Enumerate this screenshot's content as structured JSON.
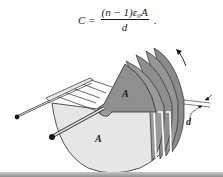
{
  "formula": {
    "lhs": "C =",
    "numerator": "(n − 1)ε₀A",
    "denominator": "d",
    "trailing": "."
  },
  "figure": {
    "labels": {
      "plate_area_upper": "A",
      "plate_area_lower": "A",
      "spacing": "d"
    },
    "colors": {
      "rotating_plates": "#8f8f8f",
      "fixed_plates": "#e4e4e4",
      "outline": "#2a2a2a",
      "rod": "#d0d0d0"
    }
  }
}
